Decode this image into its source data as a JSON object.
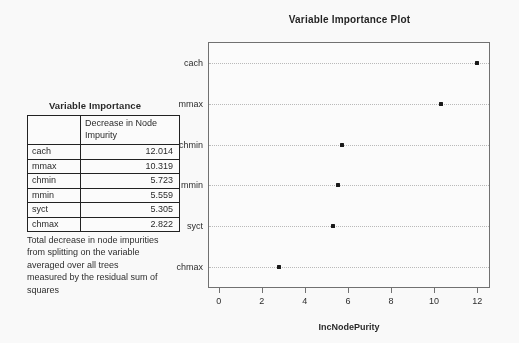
{
  "table_panel": {
    "title": "Variable Importance",
    "columns": [
      "",
      "Decrease in Node Impurity"
    ],
    "rows": [
      {
        "name": "cach",
        "value": "12.014"
      },
      {
        "name": "mmax",
        "value": "10.319"
      },
      {
        "name": "chmin",
        "value": "5.723"
      },
      {
        "name": "mmin",
        "value": "5.559"
      },
      {
        "name": "syct",
        "value": "5.305"
      },
      {
        "name": "chmax",
        "value": "2.822"
      }
    ],
    "caption": "Total decrease in node impurities from splitting on the variable averaged over all trees measured by the residual sum of squares"
  },
  "chart_data": {
    "type": "scatter",
    "title": "Variable Importance Plot",
    "xlabel": "IncNodePurity",
    "ylabel": "",
    "categories": [
      "cach",
      "mmax",
      "chmin",
      "mmin",
      "syct",
      "chmax"
    ],
    "values": [
      12.014,
      10.319,
      5.723,
      5.559,
      5.305,
      2.822
    ],
    "xlim": [
      -0.45,
      12.55
    ],
    "xticks": [
      0,
      2,
      4,
      6,
      8,
      10,
      12
    ],
    "xticklabels": [
      "0",
      "2",
      "4",
      "6",
      "8",
      "10",
      "12"
    ],
    "grid": true,
    "grid_axis": "y",
    "legend": "none",
    "marker": "filled-square",
    "marker_color": "#111111"
  }
}
